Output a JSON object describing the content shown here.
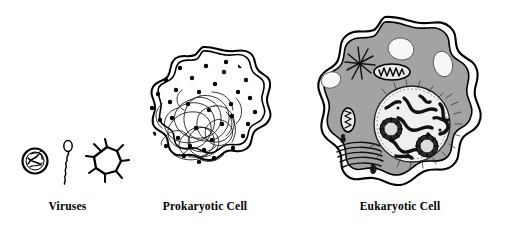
{
  "figure": {
    "background_color": "#ffffff",
    "ink_color": "#000000",
    "cytoplasm_color": "#a3a3a3",
    "vacuole_color": "#f7f7f7",
    "nucleoplasm_color": "#f0f0f0"
  },
  "panels": [
    {
      "id": "viruses",
      "label": "Viruses",
      "relative_scale": "smallest",
      "structures": [
        {
          "name": "spherical-virus",
          "description": "small round capsid with internal genetic material"
        },
        {
          "name": "filamentous-virus",
          "description": "loop head with long squiggly filament tail"
        },
        {
          "name": "spiked-virus",
          "description": "polyhedral capsid with radiating surface spikes"
        }
      ]
    },
    {
      "id": "prokaryotic-cell",
      "label": "Prokaryotic Cell",
      "relative_scale": "intermediate",
      "structures": [
        {
          "name": "cell-wall",
          "description": "outer wavy double boundary"
        },
        {
          "name": "plasma-membrane",
          "description": "inner wavy boundary line"
        },
        {
          "name": "ribosomes",
          "description": "scattered dark dots throughout cytoplasm",
          "count": 38
        },
        {
          "name": "nucleoid",
          "description": "tangled loop of circular DNA in lower region"
        }
      ]
    },
    {
      "id": "eukaryotic-cell",
      "label": "Eukaryotic Cell",
      "relative_scale": "largest",
      "structures": [
        {
          "name": "plasma-membrane",
          "description": "wavy double-line outer boundary"
        },
        {
          "name": "cytoplasm",
          "description": "gray filled interior"
        },
        {
          "name": "nucleus",
          "description": "large round organelle with stippled nuclear envelope"
        },
        {
          "name": "chromatin",
          "description": "dark condensed strands inside nucleus"
        },
        {
          "name": "nucleolus",
          "description": "two round dense bodies inside nucleus",
          "count": 2
        },
        {
          "name": "mitochondrion",
          "description": "oval organelle with internal cristae",
          "count": 2
        },
        {
          "name": "centriole",
          "description": "starburst of radiating microtubule lines"
        },
        {
          "name": "golgi-apparatus",
          "description": "stack of flattened curved cisternae"
        },
        {
          "name": "vacuole",
          "description": "white rounded vesicles",
          "count": 3
        },
        {
          "name": "vesicle",
          "description": "small dark granular bodies near golgi",
          "count": 2
        }
      ]
    }
  ]
}
